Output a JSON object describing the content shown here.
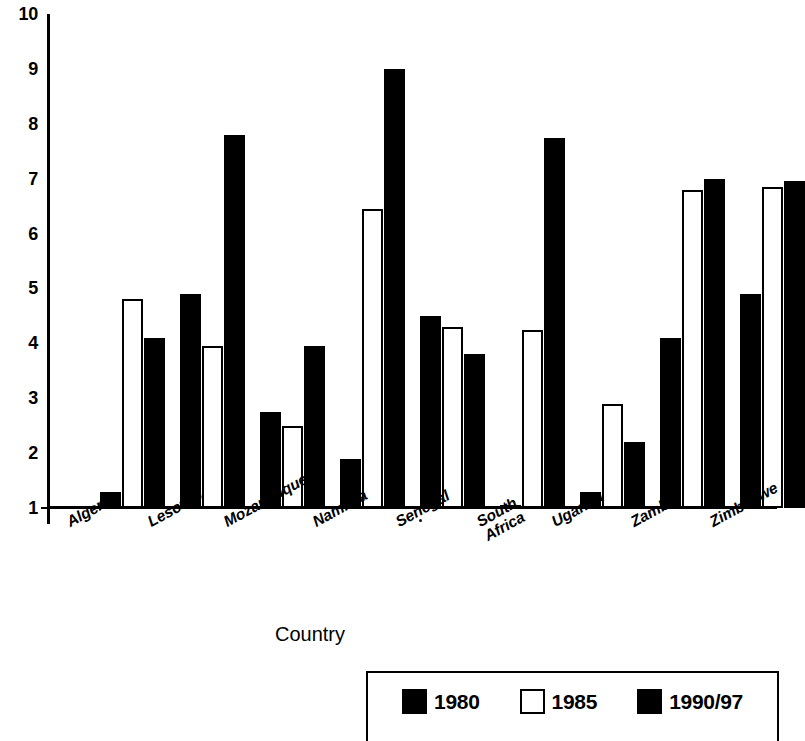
{
  "chart_data": {
    "type": "bar",
    "title": "",
    "subtitle": "",
    "xlabel": "Country",
    "ylabel": "",
    "ylim": [
      1,
      10
    ],
    "ytick_labels": [
      "10",
      "9",
      "8",
      "7",
      "6",
      "5",
      "4",
      "3",
      "2",
      "1"
    ],
    "ytick_values": [
      10,
      9,
      8,
      7,
      6,
      5,
      4,
      3,
      2,
      1
    ],
    "grid": false,
    "legend_position": "bottom-right",
    "categories": [
      "Algeria",
      "Lesotho",
      "Mozambique",
      "Namibia",
      "Senegal",
      "South\nAfrica",
      "Uganda",
      "Zambia",
      "Zimbabwe"
    ],
    "series": [
      {
        "name": "1980",
        "style": "solid",
        "color": "#000000",
        "values": [
          1.3,
          4.9,
          2.75,
          1.9,
          4.5,
          1.05,
          1.3,
          4.1,
          4.9
        ]
      },
      {
        "name": "1985",
        "style": "hollow",
        "color": "#ffffff",
        "values": [
          4.8,
          3.95,
          2.5,
          6.45,
          4.3,
          4.25,
          2.9,
          6.8,
          6.85
        ]
      },
      {
        "name": "1990/97",
        "style": "solid",
        "color": "#000000",
        "values": [
          4.1,
          7.8,
          3.95,
          9.0,
          3.8,
          7.75,
          2.2,
          7.0,
          6.95
        ]
      }
    ]
  },
  "axis": {
    "x_title": "Country"
  },
  "legend": {
    "items": [
      {
        "label": "1980",
        "style": "solid"
      },
      {
        "label": "1985",
        "style": "hollow"
      },
      {
        "label": "1990/97",
        "style": "solid"
      }
    ]
  }
}
